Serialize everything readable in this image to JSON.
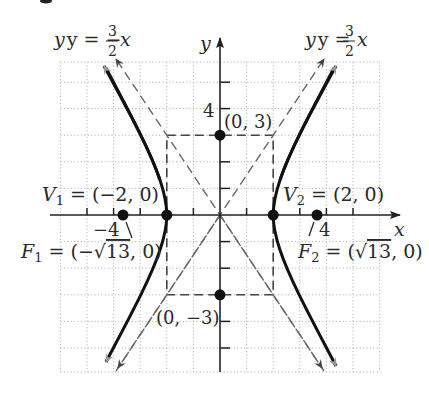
{
  "figure": {
    "type": "hyperbola",
    "equation": "x^2/4 - y^2/9 = 1",
    "origin_px": [
      220,
      215
    ],
    "unit_px": 26.6,
    "grid": {
      "xmin": -6,
      "xmax": 6,
      "ymin": -5.9,
      "ymax": 5.75,
      "style": "dotted",
      "color": "#b8b8b8"
    },
    "axes": {
      "x_label": "x",
      "y_label": "y",
      "x_tick_label": {
        "neg": "−4",
        "pos": "4"
      },
      "y_tick_label": "4"
    },
    "asymptotes": [
      {
        "name": "asymptote-negative",
        "label_lhs": "y = −",
        "num": "3",
        "den": "2",
        "var": "x",
        "slope": -1.5
      },
      {
        "name": "asymptote-positive",
        "label_lhs": "y = ",
        "num": "3",
        "den": "2",
        "var": "x",
        "slope": 1.5
      }
    ],
    "points": {
      "v1": {
        "label_main": "V",
        "sub": "1",
        "coords": " = (−2, 0)",
        "x": -2,
        "y": 0
      },
      "v2": {
        "label_main": "V",
        "sub": "2",
        "coords": " = (2, 0)",
        "x": 2,
        "y": 0
      },
      "f1": {
        "label_main": "F",
        "sub": "1",
        "coords_a": " = (−",
        "radical": "√",
        "radicand": "13",
        "coords_b": ", 0)",
        "x": -3.606,
        "y": 0
      },
      "f2": {
        "label_main": "F",
        "sub": "2",
        "coords_a": " = (",
        "radical": "√",
        "radicand": "13",
        "coords_b": ", 0)",
        "x": 3.606,
        "y": 0
      },
      "b_top": {
        "label": "(0, 3)",
        "x": 0,
        "y": 3
      },
      "b_bottom": {
        "label": "(0, −3)",
        "x": 0,
        "y": -3
      }
    },
    "colors": {
      "curve": "#111111",
      "dash": "#555555",
      "axis": "#333333",
      "dot": "#111111"
    }
  }
}
